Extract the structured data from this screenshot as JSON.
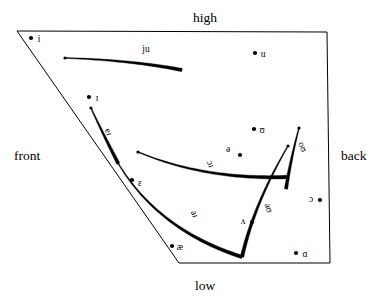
{
  "figure": {
    "kind": "vowel-quadrilateral-diagram",
    "background_color": "#ffffff",
    "ink_color": "#000000"
  },
  "axis_labels": {
    "high": "high",
    "low": "low",
    "front": "front",
    "back": "back"
  },
  "quadrilateral": {
    "corners": [
      {
        "name": "top-front",
        "x": 17,
        "y": 31
      },
      {
        "name": "top-back",
        "x": 327,
        "y": 32
      },
      {
        "name": "low-back",
        "x": 330,
        "y": 263
      },
      {
        "name": "low-front",
        "x": 179,
        "y": 263
      }
    ]
  },
  "monophthongs": [
    {
      "symbol": "i",
      "label_x": 39,
      "label_y": 42,
      "dot_x": 31,
      "dot_y": 38,
      "dot_side": "left"
    },
    {
      "symbol": "u",
      "label_x": 263,
      "label_y": 57,
      "dot_x": 255,
      "dot_y": 53,
      "dot_side": "left"
    },
    {
      "symbol": "ɪ",
      "label_x": 97,
      "label_y": 101,
      "dot_x": 89,
      "dot_y": 97,
      "dot_side": "left"
    },
    {
      "symbol": "ʊ",
      "label_x": 262,
      "label_y": 133,
      "dot_x": 254,
      "dot_y": 129,
      "dot_side": "left"
    },
    {
      "symbol": "ə",
      "label_x": 228,
      "label_y": 152,
      "dot_x": 240,
      "dot_y": 155,
      "dot_side": "right"
    },
    {
      "symbol": "ɛ",
      "label_x": 140,
      "label_y": 186,
      "dot_x": 132,
      "dot_y": 180,
      "dot_side": "left"
    },
    {
      "symbol": "ɔ",
      "label_x": 311,
      "label_y": 202,
      "dot_x": 320,
      "dot_y": 200,
      "dot_side": "right"
    },
    {
      "symbol": "ʌ",
      "label_x": 243,
      "label_y": 224,
      "dot_x": 252,
      "dot_y": 222,
      "dot_side": "right"
    },
    {
      "symbol": "æ",
      "label_x": 180,
      "label_y": 250,
      "dot_x": 172,
      "dot_y": 246,
      "dot_side": "left"
    },
    {
      "symbol": "ɑ",
      "label_x": 305,
      "label_y": 257,
      "dot_x": 296,
      "dot_y": 253,
      "dot_side": "left"
    }
  ],
  "diphthongs": [
    {
      "symbol": "ju",
      "label_x": 146,
      "label_y": 52,
      "label_rotation": 0,
      "start": {
        "x": 65,
        "y": 58
      },
      "end": {
        "x": 182,
        "y": 70
      },
      "control": {
        "x": 130,
        "y": 60
      },
      "start_width": 0.9,
      "end_width": 3.4,
      "arrow_at": "start"
    },
    {
      "symbol": "eɪ",
      "label_x": 106,
      "label_y": 133,
      "label_rotation": 70,
      "start": {
        "x": 118,
        "y": 163
      },
      "end": {
        "x": 91,
        "y": 108
      },
      "control": {
        "x": 103,
        "y": 134
      },
      "start_width": 3.4,
      "end_width": 0.9,
      "arrow_at": "end"
    },
    {
      "symbol": "ɔɪ",
      "label_x": 208,
      "label_y": 165,
      "label_rotation": 70,
      "start": {
        "x": 288,
        "y": 177
      },
      "end": {
        "x": 138,
        "y": 152
      },
      "control": {
        "x": 205,
        "y": 180
      },
      "start_width": 3.6,
      "end_width": 0.9,
      "arrow_at": "end"
    },
    {
      "symbol": "aɪ",
      "label_x": 192,
      "label_y": 215,
      "label_rotation": 70,
      "start": {
        "x": 242,
        "y": 257
      },
      "end": {
        "x": 118,
        "y": 163
      },
      "control": {
        "x": 158,
        "y": 230
      },
      "start_width": 3.6,
      "end_width": 0.9,
      "arrow_at": "end"
    },
    {
      "symbol": "aʊ",
      "label_x": 266,
      "label_y": 209,
      "label_rotation": 70,
      "start": {
        "x": 242,
        "y": 257
      },
      "end": {
        "x": 288,
        "y": 146
      },
      "control": {
        "x": 254,
        "y": 204
      },
      "start_width": 3.6,
      "end_width": 0.9,
      "arrow_at": "end"
    },
    {
      "symbol": "oʊ",
      "label_x": 300,
      "label_y": 148,
      "label_rotation": 70,
      "start": {
        "x": 286,
        "y": 189
      },
      "end": {
        "x": 299,
        "y": 128
      },
      "control": {
        "x": 291,
        "y": 158
      },
      "start_width": 3.4,
      "end_width": 0.9,
      "arrow_at": "end"
    }
  ]
}
